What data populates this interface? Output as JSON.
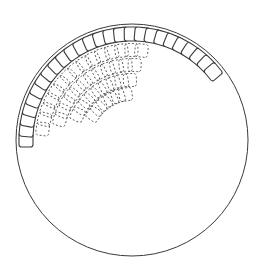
{
  "figure": {
    "type": "line-drawing",
    "background_color": "#ffffff",
    "canvas": {
      "width": 263,
      "height": 266
    },
    "circle": {
      "name": "outer-boundary-circle",
      "center_x": 132,
      "center_y": 140,
      "radius": 116,
      "stroke_color": "#3b3b3b",
      "stroke_width": 1,
      "fill": "none"
    },
    "tile_shape": {
      "name": "rounded-square",
      "corner_radius": 2.6,
      "size": 14,
      "solid_stroke_color": "#3b3b3b",
      "solid_stroke_width": 1.1,
      "dashed_stroke_color": "#585858",
      "dashed_stroke_width": 0.9,
      "dash_pattern": "2 2"
    },
    "solid_ring": {
      "name": "solid-tile-ring",
      "description": "Solid outlined rounded squares seated just inside the circle boundary, spanning from the left horizontal point clockwise over the top to the upper right.",
      "count": 26,
      "ring_radius": 106,
      "start_angle_deg": 180,
      "end_angle_deg": 320,
      "tile_size": 14
    },
    "dashed_field": {
      "name": "dashed-tile-field",
      "description": "Ghosted dashed rounded squares in concentric inner arc rows occupying the upper-left quadrant, fading inward and toward the top.",
      "rows": [
        {
          "radius": 90,
          "start_angle_deg": 187,
          "end_angle_deg": 276,
          "count": 15
        },
        {
          "radius": 75,
          "start_angle_deg": 196,
          "end_angle_deg": 272,
          "count": 12
        },
        {
          "radius": 60,
          "start_angle_deg": 205,
          "end_angle_deg": 268,
          "count": 9
        },
        {
          "radius": 46,
          "start_angle_deg": 214,
          "end_angle_deg": 262,
          "count": 6
        }
      ],
      "tile_size": 13
    }
  }
}
